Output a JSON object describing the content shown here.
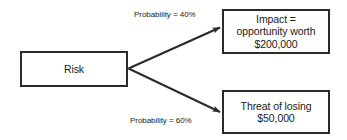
{
  "diagram": {
    "background_color": "#ffffff",
    "stroke_color": "#2b2b2b",
    "text_color": "#1a1a1a",
    "source_node": {
      "label": "Risk"
    },
    "outcome_nodes": [
      {
        "id": "impact",
        "line1": "Impact =",
        "line2": "opportunity worth",
        "line3": "$200,000"
      },
      {
        "id": "threat",
        "line1": "Threat of losing",
        "line2": "$50,000"
      }
    ],
    "edges": [
      {
        "id": "upper",
        "label": "Probability = 40%"
      },
      {
        "id": "lower",
        "label": "Probability = 60%"
      }
    ]
  }
}
